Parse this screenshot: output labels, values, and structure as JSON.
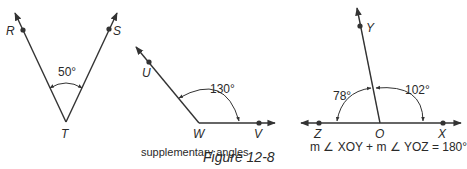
{
  "figure": {
    "title": "Figure 12-8",
    "caption": "supplementary angles"
  },
  "diagrams": [
    {
      "name": "angle-RTS",
      "points": {
        "ray1": "R",
        "vertex": "T",
        "ray2": "S"
      },
      "angle_label": "50°"
    },
    {
      "name": "angle-UWV",
      "points": {
        "ray1": "U",
        "vertex": "W",
        "ray2": "V"
      },
      "angle_label": "130°"
    },
    {
      "name": "angles-ZOY-YOX",
      "points": {
        "left": "Z",
        "vertex": "O",
        "top": "Y",
        "right": "X"
      },
      "left_angle_label": "78°",
      "right_angle_label": "102°",
      "equation": "m ∠ XOY + m ∠ YOZ = 180°"
    }
  ],
  "colors": {
    "line": "#333333",
    "text": "#2a2a2a",
    "background": "#ffffff"
  }
}
